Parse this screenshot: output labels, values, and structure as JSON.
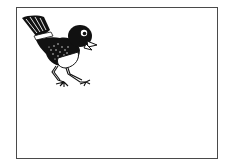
{
  "illustration": {
    "subject": "bird",
    "style": "black-and-white line drawing",
    "frame": {
      "border_color": "#4a4a4a",
      "background": "#ffffff"
    },
    "colors": {
      "ink": "#111111",
      "paper": "#ffffff"
    },
    "icons": {
      "bird": "bird-icon"
    }
  }
}
